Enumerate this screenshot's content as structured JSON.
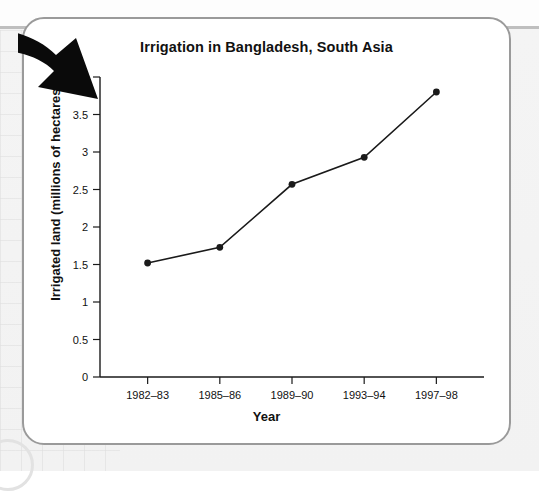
{
  "chart_data": {
    "type": "line",
    "title": "Irrigation in Bangladesh, South Asia",
    "xlabel": "Year",
    "ylabel": "Irrigated land (millions of hectares)",
    "categories": [
      "1982–83",
      "1985–86",
      "1989–90",
      "1993–94",
      "1997–98"
    ],
    "values": [
      1.52,
      1.73,
      2.57,
      2.93,
      3.8
    ],
    "ylim": [
      0,
      4
    ],
    "yticks": [
      "0",
      "0.5",
      "1",
      "1.5",
      "2",
      "2.5",
      "3",
      "3.5",
      "4"
    ],
    "ytick_values": [
      0,
      0.5,
      1,
      1.5,
      2,
      2.5,
      3,
      3.5,
      4
    ],
    "grid": false,
    "legend": "none",
    "series_color": "#1a1a1a",
    "marker": "circle"
  },
  "annotations": {
    "arrow": "curved-arrow-pointing-down-right"
  },
  "colors": {
    "card_background": "#ffffff",
    "card_border": "#9a9a9a",
    "page_background": "#f2f2f2",
    "axis": "#1a1a1a",
    "text": "#111111"
  }
}
